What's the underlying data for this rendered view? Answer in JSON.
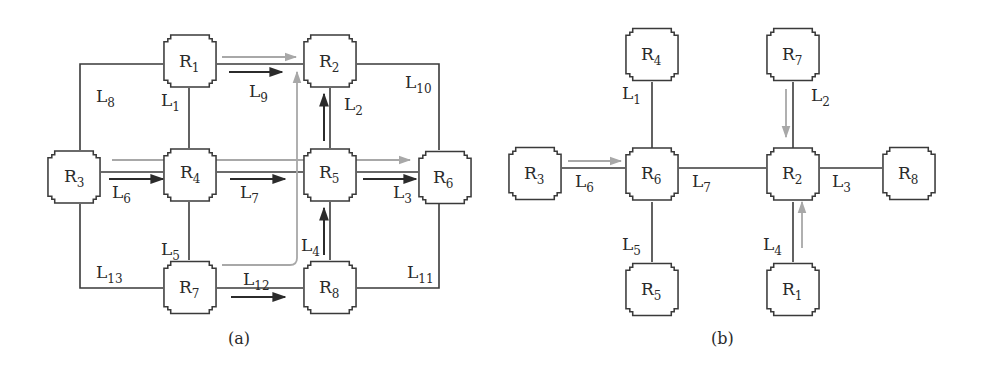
{
  "figure": {
    "panels": [
      {
        "id": "a",
        "caption": "(a)",
        "nodes": [
          {
            "name": "R",
            "sub": "1",
            "cx": 190,
            "cy": 61
          },
          {
            "name": "R",
            "sub": "2",
            "cx": 330,
            "cy": 61
          },
          {
            "name": "R",
            "sub": "3",
            "cx": 74,
            "cy": 177
          },
          {
            "name": "R",
            "sub": "4",
            "cx": 190,
            "cy": 175
          },
          {
            "name": "R",
            "sub": "5",
            "cx": 330,
            "cy": 175
          },
          {
            "name": "R",
            "sub": "6",
            "cx": 446,
            "cy": 177
          },
          {
            "name": "R",
            "sub": "7",
            "cx": 190,
            "cy": 288
          },
          {
            "name": "R",
            "sub": "8",
            "cx": 330,
            "cy": 288
          }
        ],
        "links": [
          {
            "name": "L",
            "sub": "1",
            "from": "R1",
            "to": "R4"
          },
          {
            "name": "L",
            "sub": "2",
            "from": "R2",
            "to": "R5"
          },
          {
            "name": "L",
            "sub": "3",
            "from": "R5",
            "to": "R6"
          },
          {
            "name": "L",
            "sub": "4",
            "from": "R5",
            "to": "R8"
          },
          {
            "name": "L",
            "sub": "5",
            "from": "R4",
            "to": "R7"
          },
          {
            "name": "L",
            "sub": "6",
            "from": "R3",
            "to": "R4"
          },
          {
            "name": "L",
            "sub": "7",
            "from": "R4",
            "to": "R5"
          },
          {
            "name": "L",
            "sub": "8",
            "from": "R3",
            "to": "R1"
          },
          {
            "name": "L",
            "sub": "9",
            "from": "R1",
            "to": "R2"
          },
          {
            "name": "L",
            "sub": "10",
            "from": "R2",
            "to": "R6"
          },
          {
            "name": "L",
            "sub": "11",
            "from": "R8",
            "to": "R6"
          },
          {
            "name": "L",
            "sub": "12",
            "from": "R7",
            "to": "R8"
          },
          {
            "name": "L",
            "sub": "13",
            "from": "R3",
            "to": "R7"
          }
        ],
        "flows": {
          "dark": [
            "R3→R4 (L6)",
            "R4→R5 (L7)",
            "R5→R6 (L3)",
            "R1→R2 (L9)",
            "R5→R2 (L2)",
            "R8→R5 (L4)",
            "R7→R8 (L12)"
          ],
          "gray": [
            "R3→R6 straight across",
            "R1→R2 along L9",
            "R7 → up to R2 (curved)"
          ]
        }
      },
      {
        "id": "b",
        "caption": "(b)",
        "nodes": [
          {
            "name": "R",
            "sub": "4",
            "cx": 652,
            "cy": 56
          },
          {
            "name": "R",
            "sub": "6",
            "cx": 652,
            "cy": 175
          },
          {
            "name": "R",
            "sub": "3",
            "cx": 535,
            "cy": 175
          },
          {
            "name": "R",
            "sub": "5",
            "cx": 652,
            "cy": 288
          },
          {
            "name": "R",
            "sub": "7",
            "cx": 793,
            "cy": 56
          },
          {
            "name": "R",
            "sub": "2",
            "cx": 793,
            "cy": 175
          },
          {
            "name": "R",
            "sub": "8",
            "cx": 910,
            "cy": 175
          },
          {
            "name": "R",
            "sub": "1",
            "cx": 793,
            "cy": 288
          }
        ],
        "links": [
          {
            "name": "L",
            "sub": "1",
            "from": "R4",
            "to": "R6"
          },
          {
            "name": "L",
            "sub": "2",
            "from": "R7",
            "to": "R2"
          },
          {
            "name": "L",
            "sub": "3",
            "from": "R2",
            "to": "R8"
          },
          {
            "name": "L",
            "sub": "4",
            "from": "R1",
            "to": "R2"
          },
          {
            "name": "L",
            "sub": "5",
            "from": "R6",
            "to": "R5"
          },
          {
            "name": "L",
            "sub": "6",
            "from": "R3",
            "to": "R6"
          },
          {
            "name": "L",
            "sub": "7",
            "from": "R6",
            "to": "R2"
          }
        ],
        "flows": {
          "gray": [
            "R3→R6 (L6)",
            "R7→R2 (L2)",
            "R1→R2 (L4)"
          ]
        }
      }
    ],
    "colors": {
      "line": "#3a3a3a",
      "dark_flow": "#2b2b2b",
      "gray_flow": "#a8a8a8"
    }
  }
}
